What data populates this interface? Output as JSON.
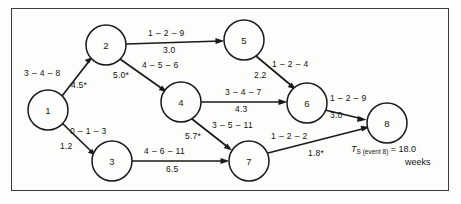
{
  "figure": {
    "type": "pert-network-diagram",
    "background_color": "#fdfdfb",
    "line_color": "#1a1a1a",
    "frame_color": "#3a3a3a"
  },
  "nodes": [
    {
      "id": "1",
      "label": "1",
      "cx": 48,
      "cy": 110,
      "r": 20
    },
    {
      "id": "2",
      "label": "2",
      "cx": 106,
      "cy": 45,
      "r": 20
    },
    {
      "id": "3",
      "label": "3",
      "cx": 112,
      "cy": 161,
      "r": 20
    },
    {
      "id": "4",
      "label": "4",
      "cx": 181,
      "cy": 102,
      "r": 20
    },
    {
      "id": "5",
      "label": "5",
      "cx": 244,
      "cy": 40,
      "r": 20
    },
    {
      "id": "6",
      "label": "6",
      "cx": 307,
      "cy": 103,
      "r": 20
    },
    {
      "id": "7",
      "label": "7",
      "cx": 249,
      "cy": 161,
      "r": 20
    },
    {
      "id": "8",
      "label": "8",
      "cx": 387,
      "cy": 123,
      "r": 20
    }
  ],
  "edges": [
    {
      "id": "e1-2",
      "from": "1",
      "to": "2",
      "estimates": "3 – 4 – 8",
      "expected": "4.5*",
      "critical": true,
      "estimates_pos": {
        "x": 24,
        "y": 68
      },
      "expected_pos": {
        "x": 71,
        "y": 80
      }
    },
    {
      "id": "e1-3",
      "from": "1",
      "to": "3",
      "estimates": "0 – 1 – 3",
      "expected": "1.2",
      "critical": false,
      "estimates_pos": {
        "x": 70,
        "y": 126
      },
      "expected_pos": {
        "x": 60,
        "y": 141
      }
    },
    {
      "id": "e2-5",
      "from": "2",
      "to": "5",
      "estimates": "1 – 2 – 9",
      "expected": "3.0",
      "critical": false,
      "estimates_pos": {
        "x": 148,
        "y": 28
      },
      "expected_pos": {
        "x": 163,
        "y": 45
      }
    },
    {
      "id": "e2-4",
      "from": "2",
      "to": "4",
      "estimates": "4 – 5 – 6",
      "expected": "5.0*",
      "critical": true,
      "estimates_pos": {
        "x": 142,
        "y": 60
      },
      "expected_pos": {
        "x": 113,
        "y": 70
      }
    },
    {
      "id": "e5-6",
      "from": "5",
      "to": "6",
      "estimates": "1 – 2 – 4",
      "expected": "2.2",
      "critical": false,
      "estimates_pos": {
        "x": 272,
        "y": 59
      },
      "expected_pos": {
        "x": 254,
        "y": 70
      }
    },
    {
      "id": "e4-6",
      "from": "4",
      "to": "6",
      "estimates": "3 – 4 – 7",
      "expected": "4.3",
      "critical": false,
      "estimates_pos": {
        "x": 225,
        "y": 87
      },
      "expected_pos": {
        "x": 235,
        "y": 104
      }
    },
    {
      "id": "e4-7",
      "from": "4",
      "to": "7",
      "estimates": "3 – 5 – 11",
      "expected": "5.7*",
      "critical": true,
      "estimates_pos": {
        "x": 212,
        "y": 120
      },
      "expected_pos": {
        "x": 185,
        "y": 131
      }
    },
    {
      "id": "e3-7",
      "from": "3",
      "to": "7",
      "estimates": "4 – 6 – 11",
      "expected": "6.5",
      "critical": false,
      "estimates_pos": {
        "x": 144,
        "y": 146
      },
      "expected_pos": {
        "x": 166,
        "y": 164
      }
    },
    {
      "id": "e6-8",
      "from": "6",
      "to": "8",
      "estimates": "1 – 2 – 9",
      "expected": "3.0",
      "critical": false,
      "estimates_pos": {
        "x": 330,
        "y": 93
      },
      "expected_pos": {
        "x": 330,
        "y": 110
      }
    },
    {
      "id": "e7-8",
      "from": "7",
      "to": "8",
      "estimates": "1 – 2 – 2",
      "expected": "1.8*",
      "critical": true,
      "estimates_pos": {
        "x": 271,
        "y": 131
      },
      "expected_pos": {
        "x": 308,
        "y": 148
      }
    }
  ],
  "annotation": {
    "symbol": "T",
    "subscript": "S (event 8)",
    "equals": "=",
    "value": "18.0",
    "units": "weeks",
    "pos": {
      "x": 351,
      "y": 144
    },
    "units_pos": {
      "x": 405,
      "y": 157
    }
  }
}
